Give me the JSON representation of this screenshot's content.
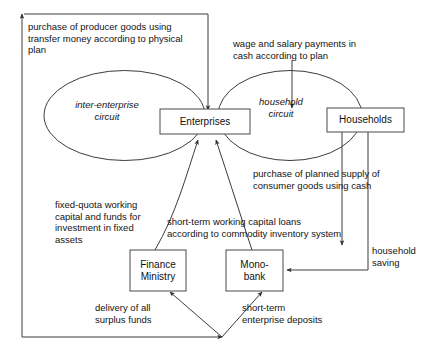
{
  "figure": {
    "type": "flow-diagram"
  },
  "nodes": {
    "enterprises": {
      "label": "Enterprises"
    },
    "households": {
      "label": "Households"
    },
    "finance_ministry": {
      "label": "Finance\nMinistry"
    },
    "monobank": {
      "label": "Mono-\nbank"
    }
  },
  "circuits": {
    "inter_enterprise": {
      "label": "inter-enterprise\ncircuit"
    },
    "household": {
      "label": "household\ncircuit"
    }
  },
  "edge_labels": {
    "producer_goods": "purchase of producer goods using\ntransfer money according to physical\nplan",
    "wage_salary": "wage and salary payments in\ncash according to plan",
    "consumer_goods": "purchase of planned supply of\nconsumer goods using cash",
    "fixed_quota": "fixed-quota working\ncapital and funds for\ninvestment in fixed\nassets",
    "short_term_loans": "short-term working capital loans\naccording to commodity inventory system",
    "household_saving": "household\nsaving",
    "surplus_funds": "delivery of all\nsurplus funds",
    "enterprise_deposits": "short-term\nenterprise deposits"
  },
  "style": {
    "line_color": "#3c3c3c",
    "text_color": "#141414",
    "box_border": "#4a4a4a",
    "background": "#ffffff"
  }
}
